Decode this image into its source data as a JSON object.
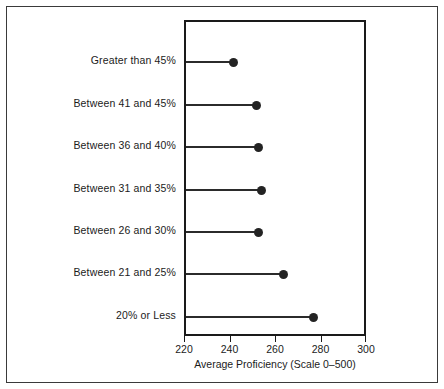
{
  "chart_data": {
    "type": "scatter",
    "title": "",
    "subtitle": "",
    "xlabel": "Average Proficiency (Scale 0–500)",
    "ylabel": "",
    "xlim": [
      220,
      300
    ],
    "xticks": [
      220,
      240,
      260,
      280,
      300
    ],
    "xticklabels": [
      "220",
      "240",
      "260",
      "280",
      "300"
    ],
    "grid": false,
    "legend": null,
    "orientation": "horizontal",
    "marker": "filled-circle",
    "stems": true,
    "categories": [
      "Greater than 45%",
      "Between 41 and 45%",
      "Between 36 and 40%",
      "Between 31 and 35%",
      "Between 26 and 30%",
      "Between 21 and 25%",
      "20% or Less"
    ],
    "values": [
      241,
      251,
      252,
      253,
      252,
      263,
      276
    ],
    "points": [
      {
        "category": "Greater than 45%",
        "value": 241
      },
      {
        "category": "Between 41 and 45%",
        "value": 251
      },
      {
        "category": "Between 36 and 40%",
        "value": 252
      },
      {
        "category": "Between 31 and 35%",
        "value": 253
      },
      {
        "category": "Between 26 and 30%",
        "value": 252
      },
      {
        "category": "Between 21 and 25%",
        "value": 263
      },
      {
        "category": "20% or Less",
        "value": 276
      }
    ],
    "colors": {
      "marker": "#232323",
      "stem": "#2b2b2b",
      "frame": "#1a1a1a",
      "text": "#1b1b1b",
      "background": "#ffffff",
      "outer_border": "#3a3a3a"
    }
  }
}
